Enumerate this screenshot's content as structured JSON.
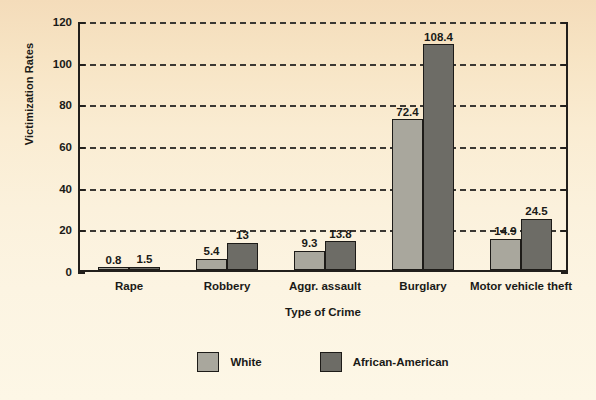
{
  "chart_data": {
    "type": "bar",
    "title": "",
    "xlabel": "Type of Crime",
    "ylabel": "Victimization Rates",
    "categories": [
      "Rape",
      "Robbery",
      "Aggr. assault",
      "Burglary",
      "Motor vehicle theft"
    ],
    "series": [
      {
        "name": "White",
        "color": "#a9a79d",
        "values": [
          0.8,
          5.4,
          9.3,
          72.4,
          14.9
        ],
        "labels": [
          "0.8",
          "5.4",
          "9.3",
          "72.4",
          "14.9"
        ]
      },
      {
        "name": "African-American",
        "color": "#6d6c66",
        "values": [
          1.5,
          13,
          13.8,
          108.4,
          24.5
        ],
        "labels": [
          "1.5",
          "13",
          "13.8",
          "108.4",
          "24.5"
        ]
      }
    ],
    "ylim": [
      0,
      120
    ],
    "yticks": [
      0,
      20,
      40,
      60,
      80,
      100,
      120
    ],
    "ytick_labels": [
      "0",
      "20",
      "40",
      "60",
      "80",
      "100",
      "120"
    ],
    "grid": "horizontal-dashed",
    "legend_position": "bottom-center"
  },
  "axes": {
    "y_title": "Victimization Rates",
    "x_title": "Type of Crime"
  },
  "legend": {
    "items": [
      {
        "label": "White",
        "color": "#a9a79d"
      },
      {
        "label": "African-American",
        "color": "#6d6c66"
      }
    ]
  },
  "colors": {
    "white_series": "#a9a79d",
    "african_american_series": "#6d6c66",
    "axis": "#221f1c",
    "grid": "#3b3833",
    "page_top": "#f4dcba",
    "page_bottom": "#fdf7e6"
  }
}
